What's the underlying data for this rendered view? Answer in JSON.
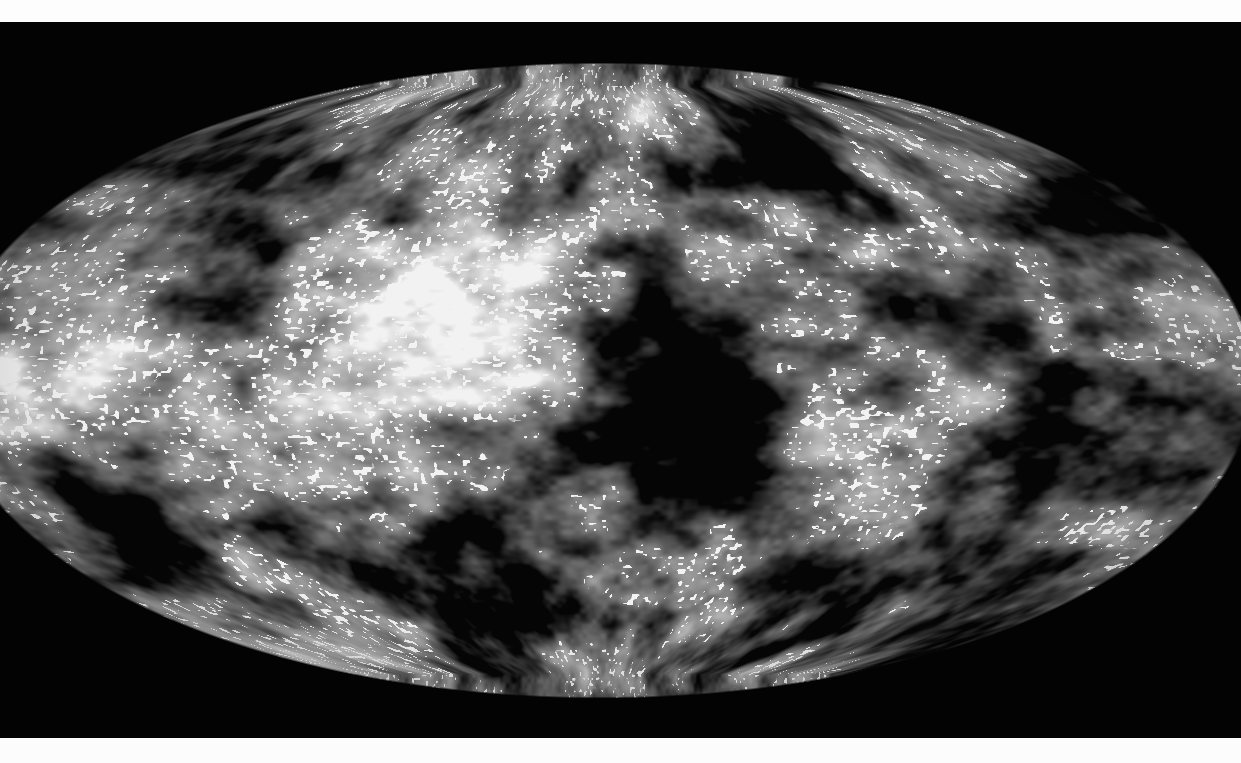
{
  "figure": {
    "name": "cmb-all-sky-map",
    "kind": "all-sky temperature anisotropy map",
    "projection": "mollweide",
    "colormap": "grayscale",
    "title": "",
    "caption": "",
    "frame": {
      "width": 1241,
      "height": 763
    },
    "bands": {
      "top": {
        "y": 0,
        "height": 22,
        "color": "#fdfdfd"
      },
      "bottom": {
        "y": 738,
        "height": 25,
        "color": "#fcfcfc"
      }
    },
    "sky": {
      "background_color": "#030303",
      "center_x": 600,
      "center_y": 380,
      "radius_x": 654,
      "radius_y": 318,
      "cropped_left": true,
      "cropped_right": false
    },
    "tones": {
      "background": "#030303",
      "mean": "#8d8d8d",
      "cold_extreme": "#050505",
      "hot_extreme": "#f2f2f2",
      "midtone_low": "#606060",
      "midtone_high": "#b4b4b4"
    },
    "texture": {
      "granule_scale_px": 9,
      "blob_scale_px": 46,
      "supercluster_scale_px": 150,
      "speckle_density": 0.06
    },
    "axis_labels": [],
    "tick_labels": [],
    "legend_entries": [],
    "annotations": [],
    "colorbar": {
      "present": false,
      "min_label": "",
      "max_label": ""
    }
  },
  "chart_data": {
    "type": "heatmap",
    "title": "",
    "xlabel": "",
    "ylabel": "",
    "projection": "mollweide",
    "grid": false,
    "legend_position": "none",
    "value_range": [
      -1.0,
      1.0
    ],
    "colormap": "grayscale",
    "cold_spot_centers": [
      [
        700,
        430
      ],
      [
        660,
        340
      ],
      [
        770,
        150
      ],
      [
        290,
        175
      ],
      [
        1080,
        210
      ],
      [
        1130,
        430
      ],
      [
        1010,
        560
      ],
      [
        430,
        560
      ],
      [
        120,
        520
      ],
      [
        560,
        600
      ],
      [
        880,
        620
      ],
      [
        205,
        290
      ],
      [
        960,
        330
      ]
    ],
    "hot_spot_centers": [
      [
        60,
        390
      ],
      [
        200,
        420
      ],
      [
        480,
        330
      ],
      [
        950,
        420
      ],
      [
        1150,
        330
      ],
      [
        330,
        640
      ],
      [
        640,
        90
      ],
      [
        855,
        500
      ]
    ]
  }
}
